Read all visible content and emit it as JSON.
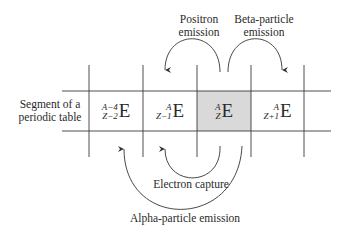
{
  "labels": {
    "positron": [
      "Positron",
      "emission"
    ],
    "beta": [
      "Beta-particle",
      "emission"
    ],
    "segment": [
      "Segment of a",
      "periodic table"
    ],
    "electron_capture": "Electron capture",
    "alpha": "Alpha-particle emission"
  },
  "cells": [
    {
      "mass": "A−4",
      "atomic": "Z−2",
      "symbol": "E",
      "highlighted": false
    },
    {
      "mass": "A",
      "atomic": "Z−1",
      "symbol": "E",
      "highlighted": false
    },
    {
      "mass": "A",
      "atomic": "Z",
      "symbol": "E",
      "highlighted": true
    },
    {
      "mass": "A",
      "atomic": "Z+1",
      "symbol": "E",
      "highlighted": false
    }
  ],
  "colors": {
    "line": "#3a3a3a",
    "highlight": "#d9d9d9",
    "text": "#2a2a2a"
  },
  "arrows": [
    {
      "name": "positron-emission",
      "from": "AZ E",
      "to": "A Z-1 E"
    },
    {
      "name": "beta-particle-emission",
      "from": "AZ E",
      "to": "A Z+1 E"
    },
    {
      "name": "electron-capture",
      "from": "AZ E",
      "to": "A Z-1 E"
    },
    {
      "name": "alpha-particle-emission",
      "from": "AZ E",
      "to": "A-4 Z-2 E"
    }
  ]
}
